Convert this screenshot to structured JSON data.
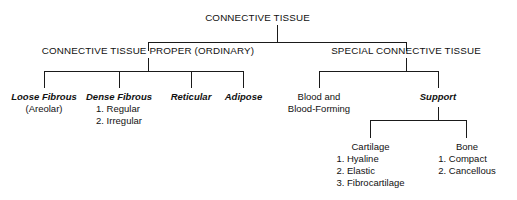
{
  "diagram": {
    "title": "CONNECTIVE TISSUE",
    "root": {
      "label": "CONNECTIVE TISSUE"
    },
    "level1": [
      {
        "label": "CONNECTIVE TISSUE PROPER (ORDINARY)"
      },
      {
        "label": "SPECIAL CONNECTIVE TISSUE"
      }
    ],
    "proper_children": [
      {
        "label": "Loose Fibrous",
        "items": [
          "(Areolar)"
        ]
      },
      {
        "label": "Dense Fibrous",
        "items": [
          "1. Regular",
          "2. Irregular"
        ]
      },
      {
        "label": "Reticular",
        "items": []
      },
      {
        "label": "Adipose",
        "items": []
      }
    ],
    "special_children": [
      {
        "label_line1": "Blood and",
        "label_line2": "Blood-Forming"
      },
      {
        "label": "Support"
      }
    ],
    "support_children": [
      {
        "label": "Cartilage",
        "items": [
          "1. Hyaline",
          "2. Elastic",
          "3. Fibrocartilage"
        ]
      },
      {
        "label": "Bone",
        "items": [
          "1. Compact",
          "2. Cancellous"
        ]
      }
    ],
    "colors": {
      "line": "#1a1a1a",
      "text": "#111111",
      "background": "#ffffff"
    }
  }
}
